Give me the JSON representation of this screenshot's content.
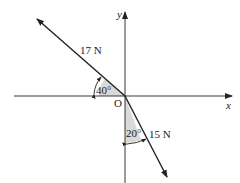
{
  "diagram": {
    "axes": {
      "x_label": "x",
      "y_label": "y",
      "origin_label": "O"
    },
    "forces": [
      {
        "name": "F1",
        "magnitude_label": "17 N",
        "angle_label": "40°",
        "angle_reference": "negative x-axis",
        "direction": "up-left"
      },
      {
        "name": "F2",
        "magnitude_label": "15 N",
        "angle_label": "20°",
        "angle_reference": "negative y-axis",
        "direction": "down-right"
      }
    ],
    "colors": {
      "line": "#222222",
      "shade": "#d9d9d9"
    }
  }
}
